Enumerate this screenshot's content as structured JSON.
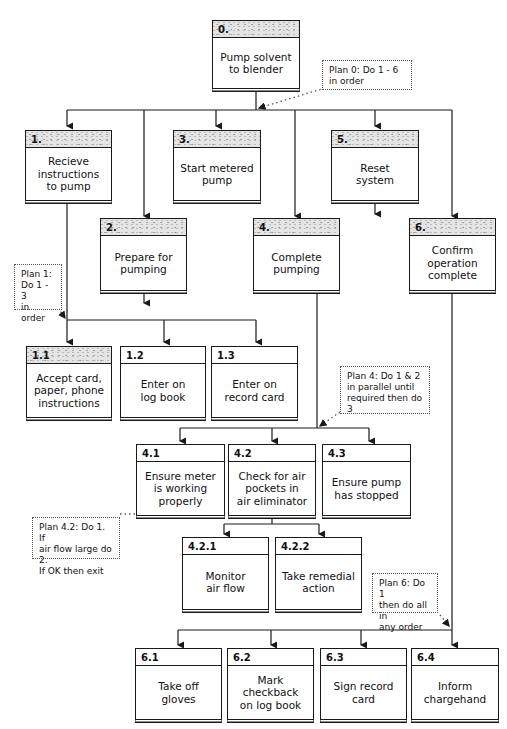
{
  "diagram": {
    "type": "hierarchical-task-analysis",
    "root": {
      "id": "0.",
      "label": "Pump solvent\nto blender"
    },
    "tasks": [
      {
        "id": "1.",
        "label": "Recieve\ninstructions\nto pump"
      },
      {
        "id": "2.",
        "label": "Prepare for\npumping"
      },
      {
        "id": "3.",
        "label": "Start metered\npump"
      },
      {
        "id": "4.",
        "label": "Complete\npumping"
      },
      {
        "id": "5.",
        "label": "Reset\nsystem"
      },
      {
        "id": "6.",
        "label": "Confirm\noperation\ncomplete"
      }
    ],
    "subtasks_1": [
      {
        "id": "1.1",
        "label": "Accept card,\npaper, phone\ninstructions"
      },
      {
        "id": "1.2",
        "label": "Enter on\nlog book"
      },
      {
        "id": "1.3",
        "label": "Enter on\nrecord card"
      }
    ],
    "subtasks_4": [
      {
        "id": "4.1",
        "label": "Ensure meter\nis working\nproperly"
      },
      {
        "id": "4.2",
        "label": "Check for air\npockets in\nair eliminator"
      },
      {
        "id": "4.3",
        "label": "Ensure pump\nhas stopped"
      }
    ],
    "subtasks_42": [
      {
        "id": "4.2.1",
        "label": "Monitor\nair flow"
      },
      {
        "id": "4.2.2",
        "label": "Take remedial\naction"
      }
    ],
    "subtasks_6": [
      {
        "id": "6.1",
        "label": "Take off gloves"
      },
      {
        "id": "6.2",
        "label": "Mark checkback\non log book"
      },
      {
        "id": "6.3",
        "label": "Sign record\ncard"
      },
      {
        "id": "6.4",
        "label": "Inform\nchargehand"
      }
    ],
    "plans": {
      "plan0": "Plan 0:  Do 1 - 6\nin order",
      "plan1": "Plan 1:\nDo 1 - 3\nin order",
      "plan4": "Plan 4:  Do 1 & 2\nin parallel until\nrequired then do 3",
      "plan42": "Plan 4.2:  Do 1.  If\nair flow large do 2.\nIf OK then exit",
      "plan6": "Plan 6:  Do 1\nthen do all in\nany order"
    },
    "colors": {
      "line": "#1a1a1a",
      "header_shade": "#e4e4e4",
      "background": "#ffffff"
    }
  }
}
